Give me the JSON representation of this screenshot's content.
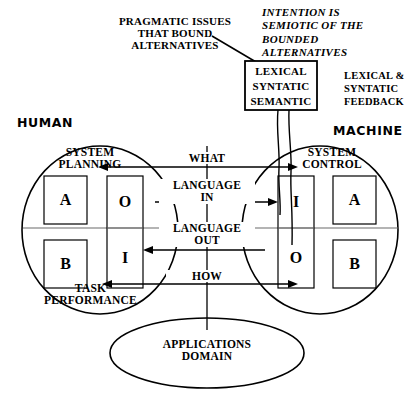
{
  "figure": {
    "type": "diagram"
  },
  "annotations": {
    "pragmatic": "PRAGMATIC ISSUES\nTHAT BOUND\nALTERNATIVES",
    "intention": "INTENTION IS\nSEMIOTIC OF THE\nBOUNDED\nALTERNATIVES",
    "feedback": "LEXICAL &\nSYNTATIC\nFEEDBACK"
  },
  "center_box": {
    "line1": "LEXICAL",
    "line2": "SYNTATIC",
    "line3": "SEMANTIC"
  },
  "sides": {
    "human": {
      "title": "HUMAN",
      "top_label": "SYSTEM\nPLANNING",
      "bottom_label": "TASK\nPERFORMANCE",
      "outer_top": "A",
      "outer_bottom": "B",
      "inner_top": "O",
      "inner_bottom": "I"
    },
    "machine": {
      "title": "MACHINE",
      "top_label": "SYSTEM\nCONTROL",
      "bottom_label": "",
      "outer_top": "A",
      "outer_bottom": "B",
      "inner_top": "I",
      "inner_bottom": "O"
    }
  },
  "flows": [
    {
      "name": "what",
      "label": "WHAT",
      "direction": "both"
    },
    {
      "name": "language-in",
      "label": "LANGUAGE\nIN",
      "direction": "right"
    },
    {
      "name": "language-out",
      "label": "LANGUAGE\nOUT",
      "direction": "left"
    },
    {
      "name": "how",
      "label": "HOW",
      "direction": "both"
    }
  ],
  "domain": {
    "label": "APPLICATIONS\nDOMAIN"
  },
  "colors": {
    "ink": "#000000",
    "midline": "#6b6b6b",
    "paper": "#ffffff"
  }
}
